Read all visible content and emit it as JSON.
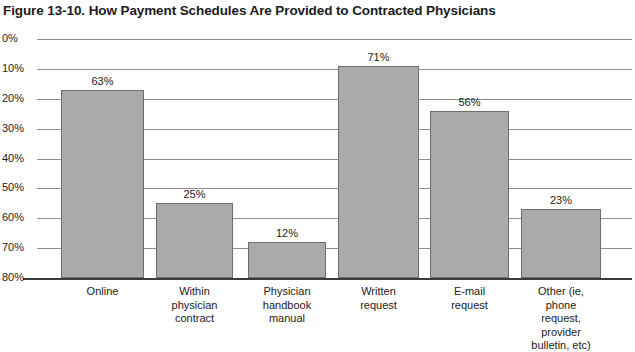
{
  "title": "Figure 13-10. How Payment Schedules Are Provided to Contracted Physicians",
  "axis": {
    "y_ticks": [
      "80%",
      "70%",
      "60%",
      "50%",
      "40%",
      "30%",
      "20%",
      "10%",
      "0%"
    ]
  },
  "bars": [
    {
      "label": "Online",
      "value_label": "63%"
    },
    {
      "label": "Within\nphysician\ncontract",
      "value_label": "25%"
    },
    {
      "label": "Physician\nhandbook\nmanual",
      "value_label": "12%"
    },
    {
      "label": "Written\nrequest",
      "value_label": "71%"
    },
    {
      "label": "E-mail\nrequest",
      "value_label": "56%"
    },
    {
      "label": "Other (ie,\nphone\nrequest,\nprovider\nbulletin, etc)",
      "value_label": "23%"
    }
  ],
  "chart_data": {
    "type": "bar",
    "title": "Figure 13-10. How Payment Schedules Are Provided to Contracted Physicians",
    "xlabel": "",
    "ylabel": "",
    "ylim": [
      0,
      80
    ],
    "ytick_values": [
      0,
      10,
      20,
      30,
      40,
      50,
      60,
      70,
      80
    ],
    "ytick_labels": [
      "0%",
      "10%",
      "20%",
      "30%",
      "40%",
      "50%",
      "60%",
      "70%",
      "80%"
    ],
    "grid": true,
    "legend": false,
    "value_labels": true,
    "bar_color": "#aaaaaa",
    "bar_edge_color": "#6e6e6e",
    "gridline_color": "#8f8f8f",
    "axis_color": "#3a3a3a",
    "categories": [
      "Online",
      "Within physician contract",
      "Physician handbook manual",
      "Written request",
      "E-mail request",
      "Other (ie, phone request, provider bulletin, etc)"
    ],
    "values": [
      63,
      25,
      12,
      71,
      56,
      23
    ],
    "units": "percent"
  }
}
